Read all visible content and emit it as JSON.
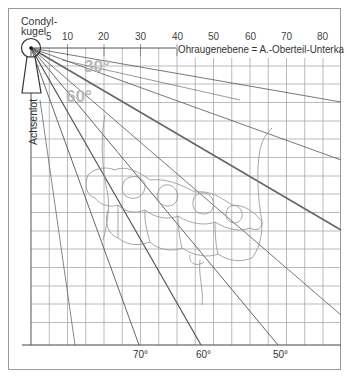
{
  "diagram": {
    "title_condyle_line1": "Condyl-",
    "title_condyle_line2": "kugel",
    "vertical_axis_label": "Achsenlot",
    "reference_plane_label": "Ohraugenebene = A.-Oberteil-Unterka",
    "top_scale": {
      "ticks": [
        {
          "label": "5",
          "value": 5
        },
        {
          "label": "10",
          "value": 10
        },
        {
          "label": "20",
          "value": 20
        },
        {
          "label": "30",
          "value": 30
        },
        {
          "label": "40",
          "value": 40
        },
        {
          "label": "50",
          "value": 50
        },
        {
          "label": "60",
          "value": 60
        },
        {
          "label": "70",
          "value": 70
        },
        {
          "label": "80",
          "value": 80
        }
      ]
    },
    "angle_labels_inner": [
      {
        "label": "30°",
        "angle": 30
      },
      {
        "label": "60°",
        "angle": 60
      }
    ],
    "angle_labels_bottom": [
      {
        "label": "70°",
        "angle": 70
      },
      {
        "label": "60°",
        "angle": 60
      },
      {
        "label": "50°",
        "angle": 50
      }
    ],
    "colors": {
      "grid": "#9a9a9a",
      "lines": "#555555",
      "teeth_outline": "#8a8a8a",
      "angle_label_gray": "#b8b8b8",
      "frame": "#888888"
    }
  }
}
